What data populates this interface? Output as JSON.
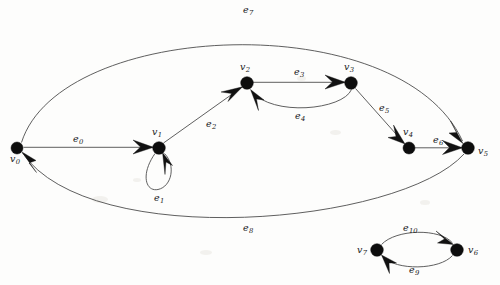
{
  "figure": {
    "width": 500,
    "height": 285,
    "background_color": "#fdfdfc",
    "edge_color": "#4d4d4d",
    "vertex_color": "#0d0d0d",
    "label_color": "#1a1a1a"
  },
  "vertices": [
    {
      "id": "v0",
      "name": "v",
      "sub": "0",
      "cx": 17,
      "cy": 148,
      "r": 6.0,
      "label_x": 10,
      "label_y": 155
    },
    {
      "id": "v1",
      "name": "v",
      "sub": "1",
      "cx": 159,
      "cy": 148,
      "r": 6.3,
      "label_x": 152,
      "label_y": 127
    },
    {
      "id": "v2",
      "name": "v",
      "sub": "2",
      "cx": 247,
      "cy": 83,
      "r": 6.3,
      "label_x": 240,
      "label_y": 62
    },
    {
      "id": "v3",
      "name": "v",
      "sub": "3",
      "cx": 351,
      "cy": 83,
      "r": 6.3,
      "label_x": 344,
      "label_y": 62
    },
    {
      "id": "v4",
      "name": "v",
      "sub": "4",
      "cx": 409,
      "cy": 148,
      "r": 6.0,
      "label_x": 403,
      "label_y": 127
    },
    {
      "id": "v5",
      "name": "v",
      "sub": "5",
      "cx": 468,
      "cy": 148,
      "r": 6.3,
      "label_x": 478,
      "label_y": 155
    },
    {
      "id": "v6",
      "name": "v",
      "sub": "6",
      "cx": 457,
      "cy": 250,
      "r": 6.3,
      "label_x": 468,
      "label_y": 256
    },
    {
      "id": "v7",
      "name": "v",
      "sub": "7",
      "cx": 377,
      "cy": 250,
      "r": 6.3,
      "label_x": 357,
      "label_y": 256
    }
  ],
  "edges": [
    {
      "id": "e0",
      "name": "e",
      "sub": "0",
      "from": "v0",
      "to": "v1",
      "kind": "straight",
      "label_x": 73,
      "label_y": 133
    },
    {
      "id": "e1",
      "name": "e",
      "sub": "1",
      "from": "v1",
      "to": "v1",
      "kind": "self-loop",
      "label_x": 154,
      "label_y": 192
    },
    {
      "id": "e2",
      "name": "e",
      "sub": "2",
      "from": "v1",
      "to": "v2",
      "kind": "straight",
      "label_x": 206,
      "label_y": 118
    },
    {
      "id": "e3",
      "name": "e",
      "sub": "3",
      "from": "v2",
      "to": "v3",
      "kind": "straight",
      "label_x": 294,
      "label_y": 66
    },
    {
      "id": "e4",
      "name": "e",
      "sub": "4",
      "from": "v3",
      "to": "v2",
      "kind": "curve-below",
      "label_x": 295,
      "label_y": 110
    },
    {
      "id": "e5",
      "name": "e",
      "sub": "5",
      "from": "v3",
      "to": "v4",
      "kind": "straight",
      "label_x": 379,
      "label_y": 102
    },
    {
      "id": "e6",
      "name": "e",
      "sub": "6",
      "from": "v4",
      "to": "v5",
      "kind": "straight",
      "label_x": 433,
      "label_y": 134
    },
    {
      "id": "e7",
      "name": "e",
      "sub": "7",
      "from": "v0",
      "to": "v5",
      "kind": "big-arc-top",
      "label_x": 243,
      "label_y": 4
    },
    {
      "id": "e8",
      "name": "e",
      "sub": "8",
      "from": "v5",
      "to": "v0",
      "kind": "big-arc-bottom",
      "label_x": 243,
      "label_y": 222
    },
    {
      "id": "e9",
      "name": "e",
      "sub": "9",
      "from": "v6",
      "to": "v7",
      "kind": "curve-below",
      "label_x": 409,
      "label_y": 264
    },
    {
      "id": "e10",
      "name": "e",
      "sub": "10",
      "from": "v7",
      "to": "v6",
      "kind": "curve-above",
      "label_x": 407,
      "label_y": 222
    }
  ]
}
